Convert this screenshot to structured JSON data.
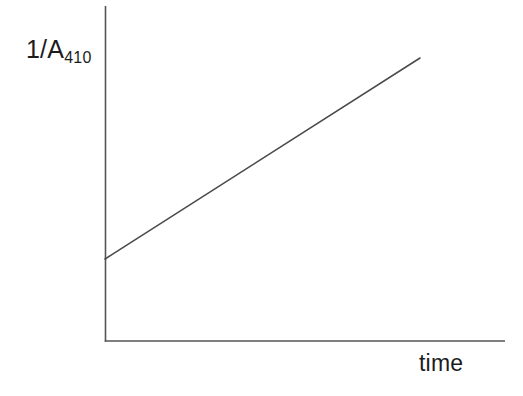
{
  "chart_data": {
    "type": "line",
    "title": "",
    "subtitle": "",
    "xlabel": "time",
    "ylabel_main": "1/A",
    "ylabel_subscript": "410",
    "ylabel": "1/A410",
    "grid": false,
    "legend": null,
    "axis_ticks": {
      "x": [],
      "y": []
    },
    "xlim": [
      0,
      1
    ],
    "ylim": [
      0,
      1
    ],
    "annotations": [],
    "series": [
      {
        "name": "1/A410 vs time",
        "description": "straight line with positive slope, non-zero y-intercept",
        "x": [
          0.0,
          0.787
        ],
        "y": [
          0.245,
          0.845
        ],
        "intercept": 0.245,
        "slope": 0.762,
        "color": "#4a4a4a"
      }
    ]
  },
  "figure": {
    "background_color": "#ffffff",
    "axis_color": "#555555",
    "line_color": "#4a4a4a",
    "text_color": "#1c1c1c",
    "geometry": {
      "axis_origin_x": 105,
      "axis_origin_y": 341,
      "y_axis_top": 6,
      "x_axis_right": 505,
      "data_start": [
        105,
        259
      ],
      "data_end": [
        420,
        58
      ]
    }
  }
}
